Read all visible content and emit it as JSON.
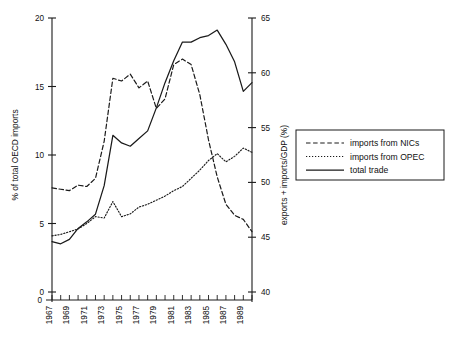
{
  "chart_data": {
    "type": "line",
    "title": "",
    "xlabel": "",
    "ylabel": "% of total OECD imports",
    "y2label": "exports + imports/GDP (%)",
    "grid": false,
    "legend_position": "right",
    "xlim": [
      1967,
      1990
    ],
    "ylim": [
      0,
      20
    ],
    "y2lim": [
      40,
      65
    ],
    "x": [
      1967,
      1968,
      1969,
      1970,
      1971,
      1972,
      1973,
      1974,
      1975,
      1976,
      1977,
      1978,
      1979,
      1980,
      1981,
      1982,
      1983,
      1984,
      1985,
      1986,
      1987,
      1988,
      1989,
      1990
    ],
    "x_tick_labels": [
      "1967",
      "1969",
      "1971",
      "1973",
      "1975",
      "1977",
      "1979",
      "1981",
      "1983",
      "1985",
      "1987",
      "1989"
    ],
    "y_tick_labels": [
      "0",
      "5",
      "10",
      "15",
      "20"
    ],
    "y_ticks": [
      0,
      5,
      10,
      15,
      20
    ],
    "y2_tick_labels": [
      "40",
      "45",
      "50",
      "55",
      "60",
      "65"
    ],
    "y2_ticks": [
      40,
      45,
      50,
      55,
      60,
      65
    ],
    "series": [
      {
        "name": "imports from NICs",
        "style": "dashed",
        "axis": "left",
        "values": [
          7.6,
          7.5,
          7.4,
          7.8,
          7.7,
          8.3,
          11.0,
          15.6,
          15.4,
          15.9,
          14.9,
          15.4,
          13.4,
          14.1,
          16.6,
          17.0,
          16.6,
          14.4,
          11.1,
          8.4,
          6.4,
          5.6,
          5.3,
          4.4
        ]
      },
      {
        "name": "imports from OPEC",
        "style": "dotted",
        "axis": "left",
        "values": [
          4.1,
          4.2,
          4.4,
          4.6,
          5.0,
          5.5,
          5.4,
          6.6,
          5.5,
          5.7,
          6.2,
          6.4,
          6.7,
          7.0,
          7.4,
          7.7,
          8.3,
          8.9,
          9.6,
          10.1,
          9.5,
          9.9,
          10.5,
          10.2
        ]
      },
      {
        "name": "total trade",
        "style": "solid",
        "axis": "right",
        "values": [
          44.6,
          44.4,
          44.8,
          45.8,
          46.4,
          47.1,
          49.7,
          54.3,
          53.6,
          53.3,
          54.0,
          54.7,
          56.8,
          59.1,
          61.1,
          62.8,
          62.8,
          63.2,
          63.4,
          63.9,
          62.6,
          61.0,
          58.3,
          59.1
        ]
      }
    ],
    "legend": [
      {
        "label": "imports from NICs",
        "style": "dashed"
      },
      {
        "label": "imports from OPEC",
        "style": "dotted"
      },
      {
        "label": "total trade",
        "style": "solid"
      }
    ]
  }
}
